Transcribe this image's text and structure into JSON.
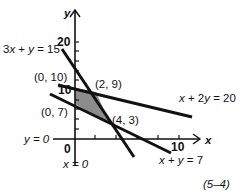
{
  "figure": {
    "caption": "(5–4)",
    "axes": {
      "x_label": "x",
      "y_label": "y",
      "origin_label": "0",
      "x_tick_label": "10",
      "y_tick_labels": [
        "10",
        "20"
      ],
      "x_axis_equation": "y = 0",
      "y_axis_equation": "x = 0"
    },
    "lines": [
      {
        "equation": "3x + y = 15",
        "label_part1": "3",
        "label_var1": "x",
        "label_part2": " + ",
        "label_var2": "y",
        "label_part3": " = 15"
      },
      {
        "equation": "x + 2y = 20",
        "label_var1": "x",
        "label_part2": " + 2",
        "label_var2": "y",
        "label_part3": " = 20"
      },
      {
        "equation": "x + y = 7",
        "label_var1": "x",
        "label_part2": " + ",
        "label_var2": "y",
        "label_part3": " = 7"
      }
    ],
    "vertices": [
      {
        "label": "(0, 10)"
      },
      {
        "label": "(2, 9)"
      },
      {
        "label": "(4, 3)"
      },
      {
        "label": "(0, 7)"
      }
    ],
    "feasible_region_color": "#8c8c8c",
    "line_color": "#111111"
  }
}
